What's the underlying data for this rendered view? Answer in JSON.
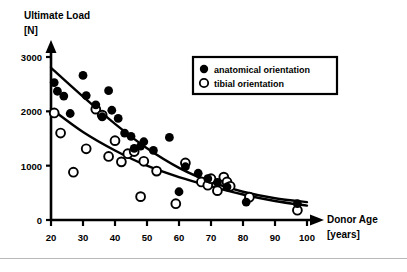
{
  "chart_data": {
    "type": "scatter",
    "title": "",
    "ylabel": "Ultimate Load",
    "yunit": "[N]",
    "xlabel": "Donor Age",
    "xunit": "[years]",
    "xlim": [
      20,
      103
    ],
    "ylim": [
      0,
      3100
    ],
    "xticks": [
      20,
      30,
      40,
      50,
      60,
      70,
      80,
      90,
      100
    ],
    "yticks": [
      0,
      1000,
      2000,
      3000
    ],
    "grid": false,
    "legend_position": "top-right",
    "series": [
      {
        "name": "anatomical orientation",
        "marker": "filled-circle",
        "color": "#000000",
        "points": [
          [
            21,
            2530
          ],
          [
            22,
            2370
          ],
          [
            24,
            2280
          ],
          [
            26,
            1960
          ],
          [
            30,
            2660
          ],
          [
            31,
            2290
          ],
          [
            34,
            2120
          ],
          [
            36,
            1900
          ],
          [
            38,
            2380
          ],
          [
            39,
            2020
          ],
          [
            41,
            1870
          ],
          [
            43,
            1600
          ],
          [
            45,
            1540
          ],
          [
            46,
            1320
          ],
          [
            48,
            1360
          ],
          [
            49,
            1440
          ],
          [
            52,
            1280
          ],
          [
            57,
            1520
          ],
          [
            60,
            520
          ],
          [
            62,
            980
          ],
          [
            66,
            860
          ],
          [
            69,
            760
          ],
          [
            72,
            690
          ],
          [
            75,
            610
          ],
          [
            81,
            330
          ],
          [
            97,
            300
          ]
        ]
      },
      {
        "name": "tibial orientation",
        "marker": "open-circle",
        "color": "#000000",
        "points": [
          [
            21,
            1970
          ],
          [
            23,
            1600
          ],
          [
            27,
            880
          ],
          [
            31,
            1310
          ],
          [
            34,
            2040
          ],
          [
            36,
            1930
          ],
          [
            38,
            1170
          ],
          [
            40,
            1460
          ],
          [
            42,
            1070
          ],
          [
            44,
            1220
          ],
          [
            46,
            1260
          ],
          [
            48,
            430
          ],
          [
            49,
            1080
          ],
          [
            53,
            900
          ],
          [
            59,
            300
          ],
          [
            62,
            1050
          ],
          [
            67,
            700
          ],
          [
            69,
            640
          ],
          [
            70,
            760
          ],
          [
            72,
            540
          ],
          [
            74,
            790
          ],
          [
            75,
            700
          ],
          [
            76,
            620
          ],
          [
            82,
            420
          ],
          [
            97,
            180
          ]
        ]
      }
    ],
    "trend_curves": [
      {
        "name": "anatomical-trend",
        "series": "anatomical orientation",
        "points": [
          [
            20,
            2800
          ],
          [
            30,
            2270
          ],
          [
            40,
            1770
          ],
          [
            50,
            1320
          ],
          [
            60,
            960
          ],
          [
            70,
            700
          ],
          [
            80,
            520
          ],
          [
            90,
            400
          ],
          [
            100,
            330
          ]
        ]
      },
      {
        "name": "tibial-trend",
        "series": "tibial orientation",
        "points": [
          [
            20,
            2050
          ],
          [
            30,
            1620
          ],
          [
            40,
            1280
          ],
          [
            50,
            1000
          ],
          [
            60,
            790
          ],
          [
            70,
            620
          ],
          [
            80,
            470
          ],
          [
            90,
            350
          ],
          [
            100,
            265
          ]
        ]
      }
    ]
  },
  "legend": {
    "items": [
      {
        "label": "anatomical orientation",
        "marker": "filled-circle"
      },
      {
        "label": "tibial orientation",
        "marker": "open-circle"
      }
    ]
  }
}
